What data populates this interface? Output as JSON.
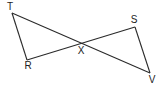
{
  "diagram": {
    "type": "geometry-figure",
    "points": [
      {
        "id": "T",
        "label": "T"
      },
      {
        "id": "R",
        "label": "R"
      },
      {
        "id": "X",
        "label": "X"
      },
      {
        "id": "S",
        "label": "S"
      },
      {
        "id": "V",
        "label": "V"
      }
    ],
    "segments": [
      {
        "from": "T",
        "to": "R"
      },
      {
        "from": "T",
        "to": "V"
      },
      {
        "from": "R",
        "to": "S"
      },
      {
        "from": "S",
        "to": "V"
      }
    ],
    "intersection": "X"
  }
}
